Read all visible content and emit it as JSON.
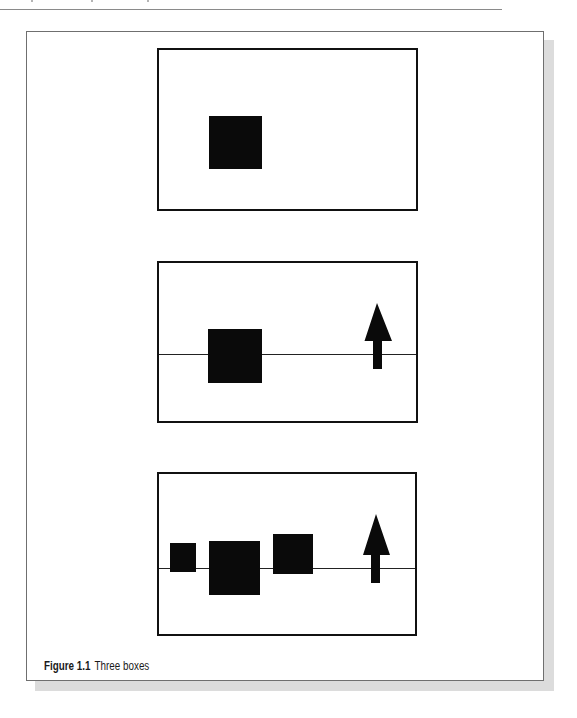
{
  "figure": {
    "caption_label": "Figure 1.1",
    "caption_text": "Three boxes"
  },
  "colors": {
    "shape_fill": "#0a0a0a",
    "panel_border": "#111111",
    "frame_border": "#6f6f6f",
    "shadow": "#dcdcdc",
    "background": "#ffffff"
  },
  "panels": [
    {
      "name": "panel-1",
      "has_baseline": false,
      "squares": [
        {
          "size": "large"
        }
      ],
      "has_arrow": false
    },
    {
      "name": "panel-2",
      "has_baseline": true,
      "squares": [
        {
          "size": "large"
        }
      ],
      "has_arrow": true,
      "arrow_direction": "up"
    },
    {
      "name": "panel-3",
      "has_baseline": true,
      "squares": [
        {
          "size": "small"
        },
        {
          "size": "large"
        },
        {
          "size": "medium"
        }
      ],
      "has_arrow": true,
      "arrow_direction": "up"
    }
  ]
}
